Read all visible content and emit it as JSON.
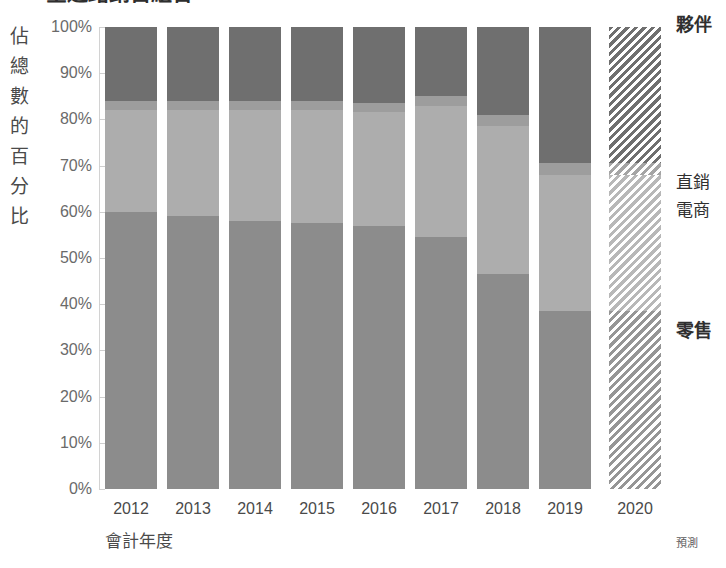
{
  "chart": {
    "title_clipped": "全通路銷售組合",
    "y_axis_title_chars": [
      "佔",
      "總",
      "數",
      "的",
      "百",
      "分",
      "比"
    ],
    "x_axis_title": "會計年度",
    "forecast_note": "預測"
  },
  "legend": [
    {
      "key": "partner",
      "label": "夥伴",
      "top": 14,
      "bold": true
    },
    {
      "key": "direct",
      "label": "直銷",
      "top": 172,
      "bold": false
    },
    {
      "key": "ecom",
      "label": "電商",
      "top": 200,
      "bold": false
    },
    {
      "key": "retail",
      "label": "零售",
      "top": 320,
      "bold": true
    }
  ],
  "chart_data": {
    "type": "bar",
    "stacked": true,
    "normalized": true,
    "title": "全通路銷售組合",
    "xlabel": "會計年度",
    "ylabel": "佔總數的百分比",
    "ylim": [
      0,
      100
    ],
    "ytick_labels": [
      "100%",
      "90%",
      "80%",
      "70%",
      "60%",
      "50%",
      "40%",
      "30%",
      "20%",
      "10%",
      "0%"
    ],
    "ytick_values": [
      100,
      90,
      80,
      70,
      60,
      50,
      40,
      30,
      20,
      10,
      0
    ],
    "grid": false,
    "legend_position": "right",
    "categories": [
      "2012",
      "2013",
      "2014",
      "2015",
      "2016",
      "2017",
      "2018",
      "2019",
      "2020"
    ],
    "forecast_categories": [
      "2020"
    ],
    "series": [
      {
        "name": "零售",
        "key": "retail",
        "values": [
          60.0,
          59.0,
          58.0,
          57.5,
          57.0,
          54.5,
          46.5,
          38.5,
          38.5
        ]
      },
      {
        "name": "電商",
        "key": "ecom",
        "values": [
          22.0,
          23.0,
          24.0,
          24.5,
          24.5,
          28.5,
          32.0,
          29.5,
          29.5
        ]
      },
      {
        "name": "直銷",
        "key": "direct",
        "values": [
          2.0,
          2.0,
          2.0,
          2.0,
          2.0,
          2.0,
          2.5,
          2.5,
          2.5
        ]
      },
      {
        "name": "夥伴",
        "key": "partner",
        "values": [
          16.0,
          16.0,
          16.0,
          16.0,
          16.5,
          15.0,
          19.0,
          29.5,
          29.5
        ]
      }
    ],
    "colors": {
      "retail": "#8c8c8c",
      "ecom": "#adadad",
      "direct": "#9d9d9d",
      "partner": "#6f6f6f"
    }
  }
}
